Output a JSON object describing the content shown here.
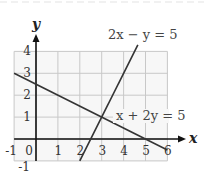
{
  "chart_data": {
    "type": "line",
    "title": "",
    "xlabel": "x",
    "ylabel": "y",
    "xlim": [
      -1,
      6
    ],
    "ylim": [
      -1,
      4
    ],
    "grid": true,
    "x_ticks": [
      "-1",
      "0",
      "1",
      "2",
      "3",
      "4",
      "5",
      "6"
    ],
    "y_ticks": [
      "-1",
      "1",
      "2",
      "3",
      "4"
    ],
    "series": [
      {
        "name": "2x − y = 5",
        "equation": "y = 2x - 5",
        "points": [
          [
            2,
            -1
          ],
          [
            4.65,
            4.3
          ]
        ],
        "label_pos": [
          108,
          39
        ]
      },
      {
        "name": "x + 2y = 5",
        "equation": "y = (5 - x) / 2",
        "points": [
          [
            -1,
            3
          ],
          [
            6,
            -0.5
          ]
        ],
        "label_pos": [
          116,
          120
        ]
      }
    ],
    "annotations": [
      {
        "text": "intersection",
        "x": 3,
        "y": 1
      }
    ],
    "colors": {
      "grid": "#c8c8c8",
      "axes": "#111111",
      "lines": "#333333"
    }
  }
}
